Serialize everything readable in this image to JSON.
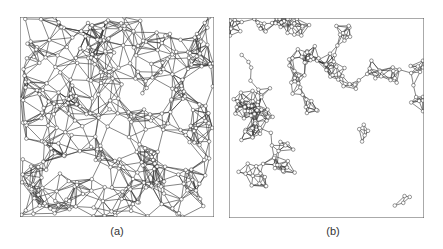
{
  "figure": {
    "panels": [
      {
        "id": "a",
        "label": "(a)",
        "description": "Dense random geometric graph with many short edges forming polygonal cells; nodes drawn as small open circles",
        "frame": {
          "x": 20,
          "y": 17,
          "w": 194,
          "h": 200
        },
        "node_count": 330,
        "connect_radius": 24,
        "seed": 7
      },
      {
        "id": "b",
        "label": "(b)",
        "description": "Sparser graph with chains and small clusters of nodes and large empty regions; nodes drawn as small open circles",
        "frame": {
          "x": 229,
          "y": 18,
          "w": 195,
          "h": 200
        },
        "node_count": 210,
        "connect_radius": 15,
        "seed": 19
      }
    ],
    "style": {
      "edge_color": "#333333",
      "node_stroke": "#333333",
      "node_fill": "#ffffff",
      "frame_color": "#555555",
      "node_radius": 1.8
    }
  }
}
